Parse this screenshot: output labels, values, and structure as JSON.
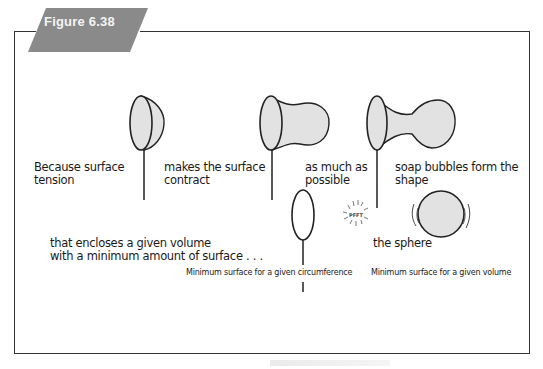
{
  "figure": {
    "label": "Figure 6.38",
    "banner_color": "#8a8a8a",
    "frame_color": "#333333",
    "fill_color": "#e2e2e2"
  },
  "panels": [
    {
      "id": "step-1",
      "text": "Because surface\ntension",
      "drawing": "bubble-wand-hemisphere"
    },
    {
      "id": "step-2",
      "text": "makes the surface\ncontract",
      "drawing": "bubble-wand-bulge"
    },
    {
      "id": "step-3",
      "text": "as much as\npossible",
      "drawing": "bubble-wand-neck"
    },
    {
      "id": "step-4",
      "text": "soap bubbles form the\nshape",
      "drawing": "empty-wand"
    },
    {
      "id": "step-5",
      "text": "that encloses a given volume\nwith a minimum amount of surface . . .",
      "drawing": ""
    },
    {
      "id": "step-6",
      "text": "the sphere",
      "drawing": "floating-sphere"
    }
  ],
  "captions": {
    "circumference": "Minimum surface for a given circumference",
    "volume": "Minimum surface for a given volume"
  },
  "sound_effect": "PFFT"
}
